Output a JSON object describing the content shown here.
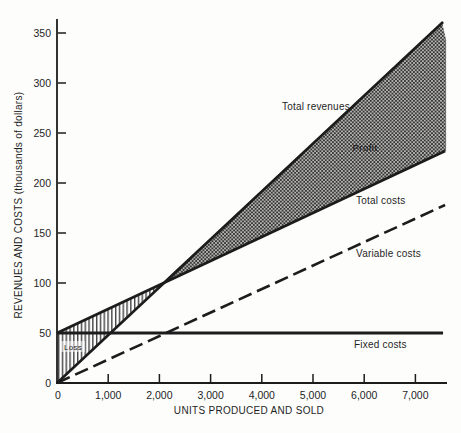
{
  "chart_data": {
    "type": "line",
    "xlabel": "UNITS PRODUCED AND SOLD",
    "ylabel": "REVENUES AND COSTS (thousands of dollars)",
    "xlim": [
      0,
      7600
    ],
    "ylim": [
      0,
      364
    ],
    "grid": false,
    "x_tick_values": [
      0,
      1000,
      2000,
      3000,
      4000,
      5000,
      6000,
      7000
    ],
    "x_tick_labels": [
      "0",
      "1,000",
      "2,000",
      "3,000",
      "4,000",
      "5,000",
      "6,000",
      "7,000"
    ],
    "y_tick_values": [
      0,
      50,
      100,
      150,
      200,
      250,
      300,
      350
    ],
    "y_tick_labels": [
      "0",
      "50",
      "100",
      "150",
      "200",
      "250",
      "300",
      "350"
    ],
    "break_even_point": {
      "units": 2000,
      "thousands_of_dollars": 100
    },
    "fixed_costs_thousands": 50,
    "revenue_per_1000_units_thousands": 50,
    "variable_cost_per_1000_units_thousands": 25,
    "plot": {
      "x0": 57,
      "y0": 383,
      "xs": 0.0512,
      "ys": 1.0,
      "axis_top": 19,
      "axis_right": 447
    },
    "series": [
      {
        "key": "total_revenues",
        "style": "solid",
        "width": 2.6,
        "points": [
          [
            0,
            0
          ],
          [
            7540,
            361
          ]
        ]
      },
      {
        "key": "total_costs",
        "style": "solid",
        "width": 2.6,
        "points": [
          [
            0,
            50
          ],
          [
            7580,
            232
          ]
        ]
      },
      {
        "key": "variable_costs",
        "style": "dashed",
        "width": 2.6,
        "points": [
          [
            0,
            0
          ],
          [
            7580,
            178
          ]
        ]
      },
      {
        "key": "fixed_costs",
        "style": "solid",
        "width": 3.0,
        "points": [
          [
            0,
            50
          ],
          [
            7540,
            50
          ]
        ]
      }
    ],
    "regions": [
      {
        "key": "profit",
        "fill": "crosshatch",
        "points": [
          [
            2010,
            98
          ],
          [
            7520,
            361
          ],
          [
            7600,
            343
          ],
          [
            7600,
            232
          ]
        ]
      },
      {
        "key": "loss",
        "fill": "vertical-hatch",
        "points": [
          [
            0,
            50
          ],
          [
            2010,
            98
          ],
          [
            0,
            0
          ]
        ]
      }
    ],
    "series_labels": {
      "total_revenues": "Total revenues",
      "total_costs": "Total costs",
      "variable_costs": "Variable costs",
      "fixed_costs": "Fixed costs"
    },
    "region_labels": {
      "profit": "Profit",
      "loss": "Loss"
    }
  }
}
